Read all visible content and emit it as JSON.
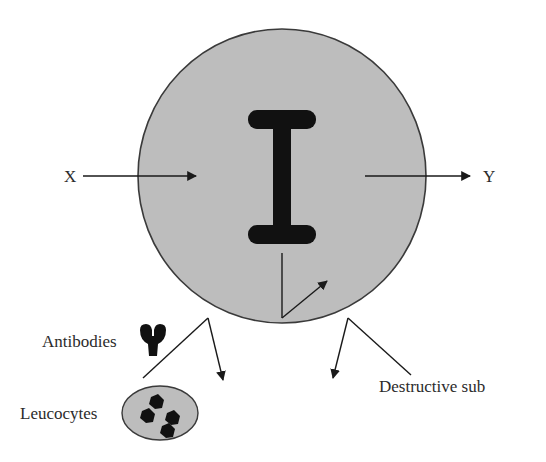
{
  "diagram": {
    "type": "biology-schematic",
    "labels": {
      "x": "X",
      "y": "Y",
      "antibodies": "Antibodies",
      "leucocytes": "Leucocytes",
      "destructive": "Destructive sub"
    },
    "elements": {
      "cell": {
        "shape": "circle",
        "fill": "#bdbdbd",
        "stroke": "#3a3a3a"
      },
      "central_structure": {
        "shape": "I-beam",
        "fill": "#111111"
      },
      "antibody": {
        "shape": "Y-glyph",
        "fill": "#111111"
      },
      "leucocyte": {
        "shape": "ellipse",
        "fill": "#bdbdbd",
        "granules": 4
      }
    },
    "arrows": [
      {
        "from": "X",
        "to": "cell-interior",
        "direction": "right"
      },
      {
        "from": "cell-interior",
        "to": "Y",
        "direction": "right"
      },
      {
        "from": "cell-bottom",
        "to": "cell-interior",
        "direction": "up-right"
      },
      {
        "from": "antibodies-leucocytes",
        "to": "below-cell",
        "direction": "down"
      },
      {
        "from": "destructive-sub",
        "to": "below-cell",
        "direction": "down"
      }
    ],
    "colors": {
      "cell_fill": "#bdbdbd",
      "outline": "#3a3a3a",
      "ink": "#111111",
      "text": "#2b2b2b",
      "background": "#ffffff"
    }
  }
}
